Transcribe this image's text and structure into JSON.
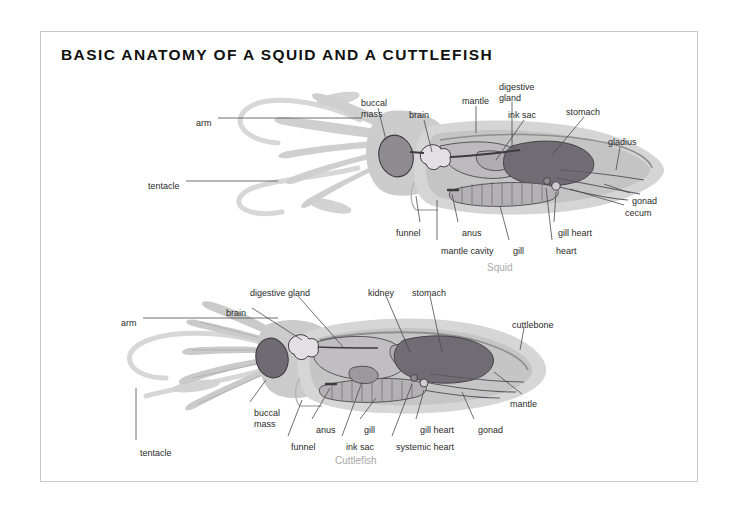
{
  "page": {
    "title": "BASIC ANATOMY OF A SQUID AND A CUTTLEFISH",
    "background": "#ffffff",
    "frame_color": "#c9c9c9"
  },
  "palette": {
    "body_outer": "#d9d9d9",
    "body_inner": "#c3c3c3",
    "organ_dark": "#6e6b73",
    "organ_mid": "#9a979d",
    "organ_light": "#b9b7bb",
    "outline": "#4a4a4a",
    "label_text": "#2b2b2b",
    "caption_text": "#a9a9a9"
  },
  "figures": [
    {
      "id": "squid",
      "caption": "Squid",
      "caption_pos": {
        "x": 487,
        "y": 262
      },
      "labels": [
        {
          "name": "arm",
          "text": "arm",
          "x": 196,
          "y": 118,
          "align": "left"
        },
        {
          "name": "tentacle",
          "text": "tentacle",
          "x": 148,
          "y": 181,
          "align": "left"
        },
        {
          "name": "buccal-mass",
          "text": "buccal\nmass",
          "x": 361,
          "y": 98,
          "align": "left"
        },
        {
          "name": "brain",
          "text": "brain",
          "x": 409,
          "y": 110,
          "align": "left"
        },
        {
          "name": "mantle",
          "text": "mantle",
          "x": 462,
          "y": 96,
          "align": "left"
        },
        {
          "name": "digestive-gland",
          "text": "digestive\ngland",
          "x": 499,
          "y": 82,
          "align": "left"
        },
        {
          "name": "ink-sac",
          "text": "ink sac",
          "x": 508,
          "y": 110,
          "align": "left"
        },
        {
          "name": "stomach",
          "text": "stomach",
          "x": 566,
          "y": 107,
          "align": "left"
        },
        {
          "name": "gladius",
          "text": "gladius",
          "x": 608,
          "y": 137,
          "align": "left"
        },
        {
          "name": "gonad",
          "text": "gonad",
          "x": 632,
          "y": 196,
          "align": "left"
        },
        {
          "name": "cecum",
          "text": "cecum",
          "x": 625,
          "y": 208,
          "align": "left"
        },
        {
          "name": "funnel",
          "text": "funnel",
          "x": 396,
          "y": 228,
          "align": "left"
        },
        {
          "name": "mantle-cavity",
          "text": "mantle cavity",
          "x": 441,
          "y": 246,
          "align": "left"
        },
        {
          "name": "anus",
          "text": "anus",
          "x": 462,
          "y": 228,
          "align": "left"
        },
        {
          "name": "gill",
          "text": "gill",
          "x": 513,
          "y": 246,
          "align": "left"
        },
        {
          "name": "gill-heart",
          "text": "gill heart",
          "x": 558,
          "y": 228,
          "align": "left"
        },
        {
          "name": "heart",
          "text": "heart",
          "x": 556,
          "y": 246,
          "align": "left"
        }
      ]
    },
    {
      "id": "cuttlefish",
      "caption": "Cuttlefish",
      "caption_pos": {
        "x": 335,
        "y": 455
      },
      "labels": [
        {
          "name": "arm",
          "text": "arm",
          "x": 121,
          "y": 318,
          "align": "left"
        },
        {
          "name": "brain",
          "text": "brain",
          "x": 226,
          "y": 308,
          "align": "left"
        },
        {
          "name": "digestive-gland",
          "text": "digestive gland",
          "x": 250,
          "y": 288,
          "align": "left"
        },
        {
          "name": "kidney",
          "text": "kidney",
          "x": 368,
          "y": 288,
          "align": "left"
        },
        {
          "name": "stomach",
          "text": "stomach",
          "x": 412,
          "y": 288,
          "align": "left"
        },
        {
          "name": "cuttlebone",
          "text": "cuttlebone",
          "x": 512,
          "y": 320,
          "align": "left"
        },
        {
          "name": "mantle",
          "text": "mantle",
          "x": 510,
          "y": 399,
          "align": "left"
        },
        {
          "name": "tentacle",
          "text": "tentacle",
          "x": 140,
          "y": 448,
          "align": "left"
        },
        {
          "name": "buccal-mass",
          "text": "buccal\nmass",
          "x": 254,
          "y": 408,
          "align": "left"
        },
        {
          "name": "funnel",
          "text": "funnel",
          "x": 291,
          "y": 442,
          "align": "left"
        },
        {
          "name": "anus",
          "text": "anus",
          "x": 316,
          "y": 425,
          "align": "left"
        },
        {
          "name": "ink-sac",
          "text": "ink sac",
          "x": 346,
          "y": 442,
          "align": "left"
        },
        {
          "name": "gill",
          "text": "gill",
          "x": 364,
          "y": 425,
          "align": "left"
        },
        {
          "name": "systemic-heart",
          "text": "systemic heart",
          "x": 396,
          "y": 442,
          "align": "left"
        },
        {
          "name": "gill-heart",
          "text": "gill heart",
          "x": 420,
          "y": 425,
          "align": "left"
        },
        {
          "name": "gonad",
          "text": "gonad",
          "x": 478,
          "y": 425,
          "align": "left"
        }
      ]
    }
  ]
}
